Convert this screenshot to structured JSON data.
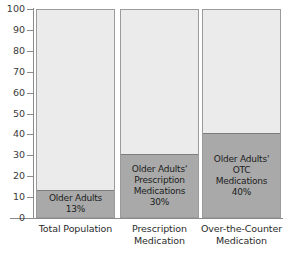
{
  "chart_data": {
    "type": "bar",
    "title": "",
    "subtitle": "",
    "xlabel": "",
    "ylabel": "",
    "ylim": [
      0,
      100
    ],
    "grid": false,
    "legend": "none",
    "stacked": true,
    "categories": [
      "Total Population",
      "Prescription Medication",
      "Over-the-Counter Medication"
    ],
    "category_lines": [
      [
        "Total Population"
      ],
      [
        "Prescription",
        "Medication"
      ],
      [
        "Over-the-Counter",
        "Medication"
      ]
    ],
    "yticks": [
      0,
      10,
      20,
      30,
      40,
      50,
      60,
      70,
      80,
      90,
      100
    ],
    "ytick_labels": [
      "0",
      "10",
      "20",
      "30",
      "40",
      "50",
      "60",
      "70",
      "80",
      "90",
      "100"
    ],
    "series": [
      {
        "name": "Older Adults share",
        "values": [
          13,
          30,
          40
        ]
      },
      {
        "name": "Remainder",
        "values": [
          87,
          70,
          60
        ]
      }
    ],
    "bar_annotations": [
      {
        "lines": [
          "Older Adults",
          "13%"
        ],
        "value": 13,
        "value_label": "13%"
      },
      {
        "lines": [
          "Older Adults'",
          "Prescription",
          "Medications",
          "30%"
        ],
        "value": 30,
        "value_label": "30%"
      },
      {
        "lines": [
          "Older Adults'",
          "OTC",
          "Medications",
          "40%"
        ],
        "value": 40,
        "value_label": "40%"
      }
    ],
    "colors": {
      "segment_fill": "#a9a9a9",
      "remainder_fill": "#ebebeb",
      "bar_border": "#9b9b9b",
      "axis": "#8a8a8a",
      "text": "#2b2b2b",
      "background": "#ffffff"
    }
  }
}
